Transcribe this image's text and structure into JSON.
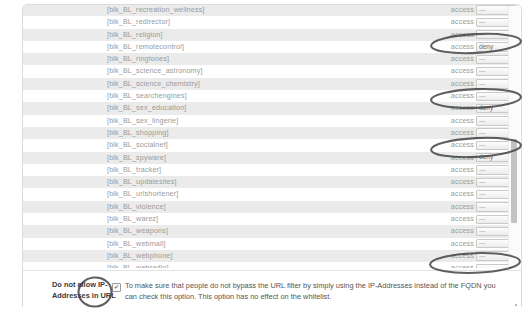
{
  "panel": {
    "scrollbar": {
      "name": "vertical-scrollbar"
    }
  },
  "list": {
    "access_label": "access",
    "dash_value": "—",
    "rows": [
      {
        "label": "[blk_BL_recreation_wellness]",
        "access": "—",
        "shaded": true,
        "circled": false
      },
      {
        "label": "[blk_BL_redirector]",
        "access": "—",
        "shaded": false,
        "circled": false
      },
      {
        "label": "[blk_BL_religion]",
        "access": "—",
        "shaded": true,
        "circled": false
      },
      {
        "label": "[blk_BL_remotecontrol]",
        "access": "deny",
        "shaded": false,
        "circled": true
      },
      {
        "label": "[blk_BL_ringtones]",
        "access": "—",
        "shaded": true,
        "circled": false
      },
      {
        "label": "[blk_BL_science_astronomy]",
        "access": "—",
        "shaded": false,
        "circled": false
      },
      {
        "label": "[blk_BL_science_chemistry]",
        "access": "—",
        "shaded": true,
        "circled": false
      },
      {
        "label": "[blk_BL_searchengines]",
        "access": "—",
        "shaded": false,
        "circled": false
      },
      {
        "label": "[blk_BL_sex_education]",
        "access": "deny",
        "shaded": true,
        "circled": true
      },
      {
        "label": "[blk_BL_sex_lingerie]",
        "access": "—",
        "shaded": false,
        "circled": false
      },
      {
        "label": "[blk_BL_shopping]",
        "access": "—",
        "shaded": true,
        "circled": false
      },
      {
        "label": "[blk_BL_socialnet]",
        "access": "—",
        "shaded": false,
        "circled": false
      },
      {
        "label": "[blk_BL_spyware]",
        "access": "deny",
        "shaded": true,
        "circled": true
      },
      {
        "label": "[blk_BL_tracker]",
        "access": "—",
        "shaded": false,
        "circled": false
      },
      {
        "label": "[blk_BL_updatesites]",
        "access": "—",
        "shaded": true,
        "circled": false
      },
      {
        "label": "[blk_BL_urlshortener]",
        "access": "—",
        "shaded": false,
        "circled": false
      },
      {
        "label": "[blk_BL_violence]",
        "access": "—",
        "shaded": true,
        "circled": false
      },
      {
        "label": "[blk_BL_warez]",
        "access": "—",
        "shaded": false,
        "circled": false
      },
      {
        "label": "[blk_BL_weapons]",
        "access": "—",
        "shaded": true,
        "circled": false
      },
      {
        "label": "[blk_BL_webmail]",
        "access": "—",
        "shaded": false,
        "circled": false
      },
      {
        "label": "[blk_BL_webphone]",
        "access": "—",
        "shaded": true,
        "circled": false
      },
      {
        "label": "[blk_BL_webradio]",
        "access": "—",
        "shaded": false,
        "circled": false
      },
      {
        "label": "[blk_BL_webtv]",
        "access": "—",
        "shaded": true,
        "circled": false
      },
      {
        "label": "Default access [all]",
        "access": "allow",
        "shaded": false,
        "circled": true,
        "is_default": true
      }
    ]
  },
  "footer": {
    "label": "Do not allow IP-Addresses in URL",
    "checkbox_checked": true,
    "checkbox_glyph": "✔",
    "description": "To make sure that people do not bypass the URL filter by simply using the IP-Addresses instead of the FQDN you can check this option. This option has no effect on the whitelist."
  },
  "colors": {
    "row_shaded": "#ebebeb",
    "row_plain": "#ffffff",
    "text_muted": "#9a9a9a",
    "annotation": "#3d3d3d",
    "scroll_thumb": "#c2c2c2"
  }
}
